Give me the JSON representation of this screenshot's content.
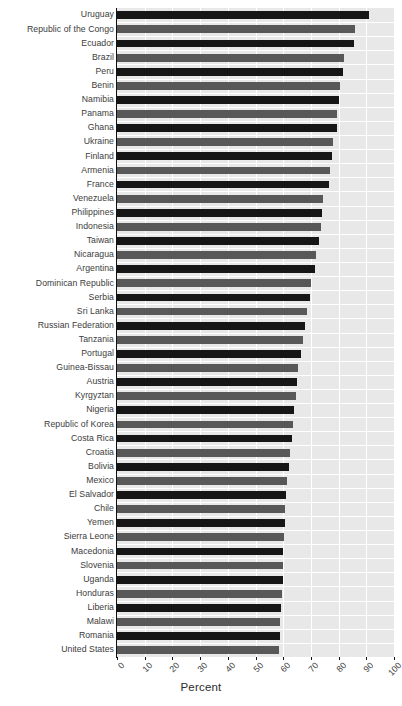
{
  "chart_data": {
    "type": "bar",
    "orientation": "horizontal",
    "title": "",
    "subtitle": "",
    "xlabel": "Percent",
    "ylabel": "",
    "xlim": [
      0,
      100
    ],
    "xticks": [
      0,
      10,
      20,
      30,
      40,
      50,
      60,
      70,
      80,
      90,
      100
    ],
    "xtick_labels": [
      "0",
      "10",
      "20",
      "30",
      "40",
      "50",
      "60",
      "70",
      "80",
      "90",
      "100"
    ],
    "grid": true,
    "grid_color": "#ffffff",
    "panel_background": "#e8e8e8",
    "legend": null,
    "bar_colors": [
      "#161616",
      "#585858"
    ],
    "categories": [
      "Uruguay",
      "Republic of the Congo",
      "Ecuador",
      "Brazil",
      "Peru",
      "Benin",
      "Namibia",
      "Panama",
      "Ghana",
      "Ukraine",
      "Finland",
      "Armenia",
      "France",
      "Venezuela",
      "Philippines",
      "Indonesia",
      "Taiwan",
      "Nicaragua",
      "Argentina",
      "Dominican Republic",
      "Serbia",
      "Sri Lanka",
      "Russian Federation",
      "Tanzania",
      "Portugal",
      "Guinea-Bissau",
      "Austria",
      "Kyrgyztan",
      "Nigeria",
      "Republic of Korea",
      "Costa Rica",
      "Croatia",
      "Bolivia",
      "Mexico",
      "El Salvador",
      "Chile",
      "Yemen",
      "Sierra Leone",
      "Macedonia",
      "Slovenia",
      "Uganda",
      "Honduras",
      "Liberia",
      "Malawi",
      "Romania",
      "United States"
    ],
    "values": [
      91.0,
      86.0,
      85.5,
      82.0,
      81.5,
      80.5,
      80.0,
      79.5,
      79.5,
      78.0,
      77.5,
      77.0,
      76.5,
      74.5,
      74.0,
      73.5,
      73.0,
      72.0,
      71.5,
      70.0,
      69.5,
      68.5,
      68.0,
      67.0,
      66.5,
      65.5,
      65.0,
      64.5,
      64.0,
      63.5,
      63.0,
      62.5,
      62.0,
      61.5,
      61.0,
      60.8,
      60.5,
      60.2,
      60.0,
      60.0,
      59.8,
      59.5,
      59.3,
      59.0,
      58.8,
      58.5
    ]
  }
}
